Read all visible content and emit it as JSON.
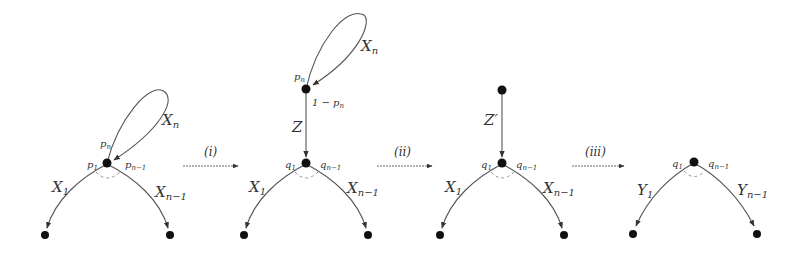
{
  "diagram": {
    "steps": [
      {
        "id": "i",
        "label": "(i)"
      },
      {
        "id": "ii",
        "label": "(ii)"
      },
      {
        "id": "iii",
        "label": "(iii)"
      }
    ],
    "panels": [
      {
        "id": "panel1",
        "loop_label": "X",
        "loop_sub": "n",
        "prob_loop": "p",
        "prob_loop_sub": "n",
        "left_prob": "p",
        "left_prob_sub": "1",
        "right_prob": "p",
        "right_prob_sub": "n−1",
        "left_edge": "X",
        "left_edge_sub": "1",
        "right_edge": "X",
        "right_edge_sub": "n−1"
      },
      {
        "id": "panel2",
        "loop_label": "X",
        "loop_sub": "n",
        "prob_loop": "p",
        "prob_loop_sub": "n",
        "prob_down": "1 − p",
        "prob_down_sub": "n",
        "vert_edge": "Z",
        "left_prob": "q",
        "left_prob_sub": "1",
        "right_prob": "q",
        "right_prob_sub": "n−1",
        "left_edge": "X",
        "left_edge_sub": "1",
        "right_edge": "X",
        "right_edge_sub": "n−1"
      },
      {
        "id": "panel3",
        "vert_edge": "Z′",
        "left_prob": "q",
        "left_prob_sub": "1",
        "right_prob": "q",
        "right_prob_sub": "n−1",
        "left_edge": "X",
        "left_edge_sub": "1",
        "right_edge": "X",
        "right_edge_sub": "n−1"
      },
      {
        "id": "panel4",
        "left_prob": "q",
        "left_prob_sub": "1",
        "right_prob": "q",
        "right_prob_sub": "n−1",
        "left_edge": "Y",
        "left_edge_sub": "1",
        "right_edge": "Y",
        "right_edge_sub": "n−1"
      }
    ]
  }
}
